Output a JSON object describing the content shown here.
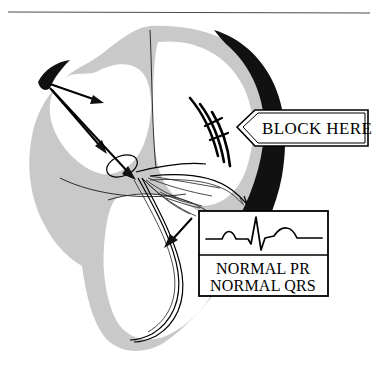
{
  "figure": {
    "top_rule": "horizontal-rule"
  },
  "callout": {
    "label": "BLOCK HERE",
    "pointer_direction": "left",
    "target": "bundle-of-his-right-side"
  },
  "ecg_inset": {
    "waveform_name": "normal-sinus-pqrst-complex",
    "line1": "NORMAL PR",
    "line2": "NORMAL QRS"
  },
  "anatomy": {
    "sa_node": "sa-node-marker",
    "av_node": "av-node-marker",
    "impulse_arrows": 3,
    "bundle_branch_arrow": "left-bundle-branch-arrow",
    "block_marks": 3
  },
  "colors": {
    "myocardium_gray": "#c9c9c9",
    "thickened_wall_black": "#111111",
    "chamber_white": "#ffffff",
    "ink": "#000000",
    "rule_gray": "#4a4a4a"
  }
}
